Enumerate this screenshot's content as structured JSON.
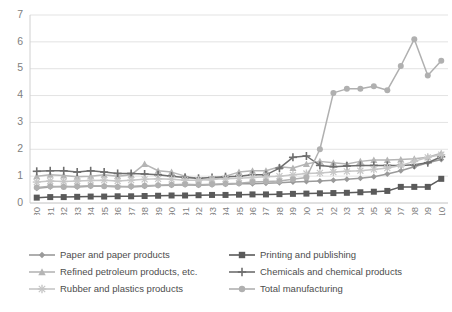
{
  "chart_data": {
    "type": "line",
    "title": "",
    "xlabel": "",
    "ylabel": "",
    "ylim": [
      0,
      7
    ],
    "yticks": [
      0,
      1,
      2,
      3,
      4,
      5,
      6,
      7
    ],
    "grid": true,
    "legend_position": "bottom",
    "categories": [
      "1980",
      "1981",
      "1982",
      "1983",
      "1984",
      "1985",
      "1986",
      "1987",
      "1988",
      "1989",
      "1990",
      "1991",
      "1992",
      "1993",
      "1994",
      "1995",
      "1996",
      "1997",
      "1998",
      "1999",
      "2000",
      "2001",
      "2002",
      "2003",
      "2004",
      "2005",
      "2006",
      "2007",
      "2008",
      "2009",
      "2010"
    ],
    "series": [
      {
        "name": "Paper and paper products",
        "marker": "diamond",
        "color": "#9a9a9a",
        "values": [
          0.55,
          0.6,
          0.62,
          0.6,
          0.62,
          0.63,
          0.62,
          0.6,
          0.62,
          0.65,
          0.66,
          0.68,
          0.66,
          0.68,
          0.7,
          0.72,
          0.72,
          0.74,
          0.75,
          0.78,
          0.8,
          0.82,
          0.85,
          0.88,
          0.92,
          0.98,
          1.08,
          1.2,
          1.35,
          1.5,
          1.62
        ]
      },
      {
        "name": "Printing and publishing",
        "marker": "square",
        "color": "#5a5a5a",
        "values": [
          0.2,
          0.22,
          0.22,
          0.23,
          0.24,
          0.24,
          0.25,
          0.25,
          0.26,
          0.27,
          0.28,
          0.28,
          0.29,
          0.3,
          0.3,
          0.31,
          0.32,
          0.32,
          0.33,
          0.34,
          0.35,
          0.36,
          0.37,
          0.38,
          0.4,
          0.42,
          0.45,
          0.6,
          0.6,
          0.6,
          0.9
        ]
      },
      {
        "name": "Refined petroleum products, etc.",
        "marker": "triangle",
        "color": "#b5b5b5",
        "values": [
          1.0,
          1.05,
          1.02,
          0.98,
          1.0,
          1.05,
          1.0,
          1.05,
          1.45,
          1.2,
          1.15,
          1.0,
          0.9,
          0.85,
          1.0,
          1.15,
          1.2,
          1.2,
          1.35,
          1.3,
          1.45,
          1.55,
          1.5,
          1.45,
          1.55,
          1.6,
          1.6,
          1.62,
          1.65,
          1.7,
          1.85
        ]
      },
      {
        "name": "Chemicals and chemical products",
        "marker": "cross",
        "color": "#6e6e6e",
        "values": [
          1.18,
          1.2,
          1.2,
          1.15,
          1.2,
          1.15,
          1.1,
          1.1,
          1.08,
          1.05,
          1.0,
          0.95,
          0.92,
          0.95,
          0.98,
          1.0,
          1.05,
          1.05,
          1.3,
          1.7,
          1.75,
          1.4,
          1.35,
          1.38,
          1.4,
          1.4,
          1.4,
          1.4,
          1.42,
          1.5,
          1.72
        ]
      },
      {
        "name": "Rubber and plastics products",
        "marker": "star",
        "color": "#c6c6c6",
        "values": [
          0.78,
          0.82,
          0.8,
          0.82,
          0.84,
          0.85,
          0.82,
          0.85,
          0.88,
          0.9,
          0.88,
          0.85,
          0.85,
          0.88,
          0.9,
          0.92,
          0.95,
          0.98,
          1.0,
          1.05,
          1.1,
          1.12,
          1.15,
          1.18,
          1.2,
          1.25,
          1.3,
          1.4,
          1.55,
          1.7,
          1.8
        ]
      },
      {
        "name": "Total manufacturing",
        "marker": "circle",
        "color": "#b0b0b0",
        "values": [
          0.58,
          0.62,
          0.6,
          0.62,
          0.64,
          0.62,
          0.6,
          0.62,
          0.64,
          0.66,
          0.68,
          0.7,
          0.68,
          0.7,
          0.72,
          0.74,
          0.78,
          0.8,
          0.82,
          0.88,
          0.95,
          2.0,
          4.1,
          4.25,
          4.25,
          4.35,
          4.2,
          5.1,
          6.1,
          4.75,
          5.3
        ]
      }
    ]
  },
  "legend": {
    "items": [
      {
        "label": "Paper and paper products",
        "marker": "diamond",
        "color": "#9a9a9a"
      },
      {
        "label": "Printing and publishing",
        "marker": "square",
        "color": "#5a5a5a"
      },
      {
        "label": "Refined petroleum products, etc.",
        "marker": "triangle",
        "color": "#b5b5b5"
      },
      {
        "label": "Chemicals and chemical products",
        "marker": "cross",
        "color": "#6e6e6e"
      },
      {
        "label": "Rubber and plastics products",
        "marker": "star",
        "color": "#c6c6c6"
      },
      {
        "label": "Total manufacturing",
        "marker": "circle",
        "color": "#b0b0b0"
      }
    ]
  },
  "style": {
    "grid_color": "#e3e3e3",
    "axis_color": "#d0d0d0",
    "tick_text_color": "#808080",
    "background": "#ffffff"
  },
  "caption": {
    "text": ""
  }
}
